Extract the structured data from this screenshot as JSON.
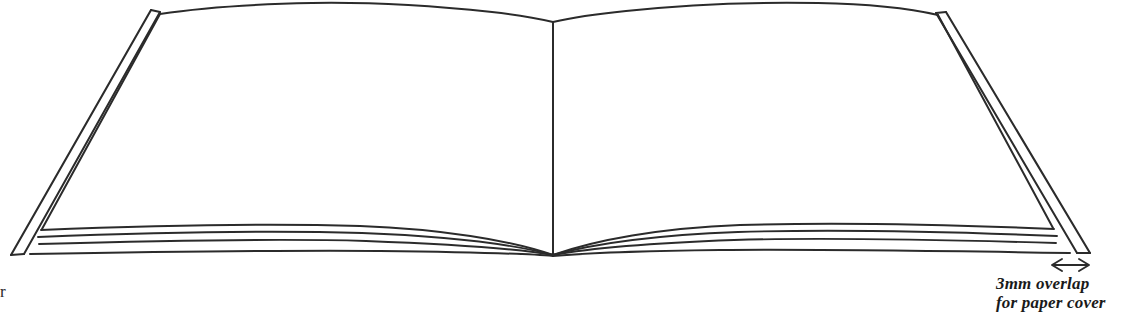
{
  "figure": {
    "name": "open-book-perspective-diagram",
    "type": "line-drawing",
    "background_color": "#ffffff",
    "ink_color": "#2b2b2b",
    "width": 1131,
    "height": 319
  },
  "annotations": {
    "overlap": {
      "line1": "3mm overlap",
      "line2": "for paper cover",
      "measurement": "3mm",
      "subject": "paper cover overlap",
      "color": "#1a1a1a"
    },
    "left_edge_fragment": {
      "text": "r"
    }
  },
  "dimension_arrow": {
    "name": "overlap-dimension-arrow",
    "label": "3mm overlap",
    "x_start": 1052,
    "x_end": 1089,
    "y": 265,
    "style": "double-headed"
  },
  "book": {
    "parts": [
      {
        "name": "left-cover-board",
        "label": "Left cover board"
      },
      {
        "name": "right-cover-board",
        "label": "Right cover board"
      },
      {
        "name": "left-page-block",
        "label": "Left page block"
      },
      {
        "name": "right-page-block",
        "label": "Right page block"
      },
      {
        "name": "spine-center-line",
        "label": "Spine centre"
      },
      {
        "name": "left-page-stack-lines",
        "label": "Left stacked leaves"
      },
      {
        "name": "right-page-stack-lines",
        "label": "Right stacked leaves"
      }
    ],
    "geometry": {
      "spine_x": 553,
      "spine_top_y": 22,
      "spine_bottom_y": 256,
      "left_cover_top": [
        152,
        10
      ],
      "left_cover_bottom": [
        12,
        255
      ],
      "right_cover_top": [
        945,
        12
      ],
      "right_cover_bottom": [
        1090,
        253
      ],
      "left_page_top_outer": [
        157,
        15
      ],
      "right_page_top_outer": [
        938,
        16
      ],
      "page_stack_line_count": 4
    }
  }
}
